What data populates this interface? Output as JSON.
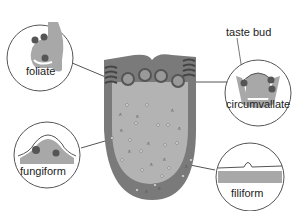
{
  "diagram": {
    "colors": {
      "tongue_outer": "#7a7a7a",
      "tongue_inner": "#b3b3b3",
      "bud": "#555555",
      "circle_stroke": "#555555",
      "background": "#ffffff"
    },
    "labels": {
      "foliate": "foliate",
      "taste_bud": "taste bud",
      "circumvallate": "circumvallate",
      "fungiform": "fungiform",
      "filiform": "filiform"
    }
  }
}
